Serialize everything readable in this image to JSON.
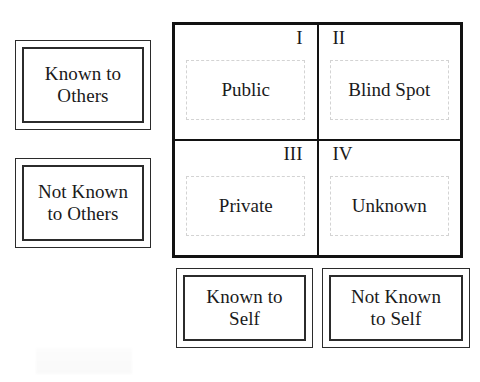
{
  "diagram": {
    "row_labels": [
      {
        "id": "known-to-others",
        "text": "Known to\nOthers"
      },
      {
        "id": "not-known-to-others",
        "text": "Not Known\nto Others"
      }
    ],
    "column_labels": [
      {
        "id": "known-to-self",
        "text": "Known to\nSelf"
      },
      {
        "id": "not-known-to-self",
        "text": "Not Known\nto Self"
      }
    ],
    "quadrants": [
      {
        "id": "public",
        "numeral": "I",
        "numeral_position": "right",
        "label": "Public"
      },
      {
        "id": "blind-spot",
        "numeral": "II",
        "numeral_position": "left",
        "label": "Blind Spot"
      },
      {
        "id": "private",
        "numeral": "III",
        "numeral_position": "right",
        "label": "Private"
      },
      {
        "id": "unknown",
        "numeral": "IV",
        "numeral_position": "left",
        "label": "Unknown"
      }
    ],
    "colors": {
      "grid_border": "#121212",
      "label_border": "#2b2b2b",
      "cell_border": "#d3d3d3",
      "text": "#1a1a1a",
      "background": "#ffffff"
    }
  }
}
